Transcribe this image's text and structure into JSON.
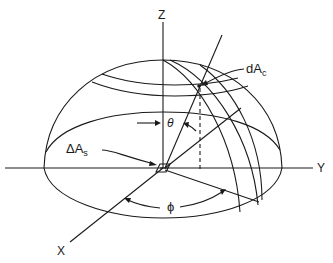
{
  "diagram": {
    "labels": {
      "z_axis": "Z",
      "y_axis": "Y",
      "x_axis": "X",
      "theta": "θ",
      "phi": "ϕ",
      "dAc_main": "dA",
      "dAc_sub": "c",
      "dAs_main": "ΔA",
      "dAs_sub": "s"
    },
    "colors": {
      "stroke": "#1a1a1a",
      "background": "#ffffff"
    }
  }
}
